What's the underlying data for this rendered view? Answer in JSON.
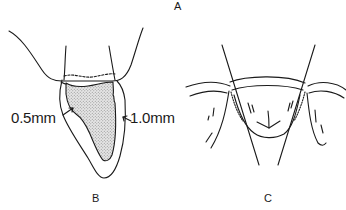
{
  "figure": {
    "panels": [
      {
        "id": "A",
        "label": "A"
      },
      {
        "id": "B",
        "label": "B",
        "annotations": [
          {
            "text": "0.5mm",
            "side": "labial"
          },
          {
            "text": "1.0mm",
            "side": "lingual"
          }
        ]
      },
      {
        "id": "C",
        "label": "C"
      }
    ],
    "colors": {
      "stroke": "#1a1a1a",
      "stipple": "#c8c8c8",
      "background": "#ffffff"
    }
  }
}
